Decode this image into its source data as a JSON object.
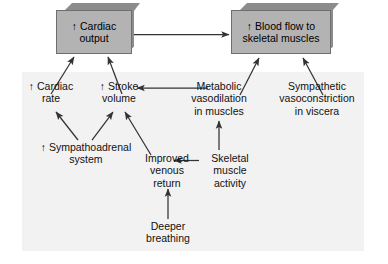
{
  "diagram": {
    "panel_color": "#f2f2f2",
    "box_face_color": "#b3b3b3",
    "box_shade_color": "#8c8c8c",
    "arrow_color": "#333333",
    "text_color": "#111111",
    "boxes": [
      {
        "id": "cardiac-output",
        "line1": "↑ Cardiac",
        "line2": "output",
        "text": "↑ Cardiac output"
      },
      {
        "id": "blood-flow",
        "line1": "↑ Blood flow to",
        "line2": "skeletal muscles",
        "text": "↑ Blood flow to skeletal muscles"
      }
    ],
    "nodes": [
      {
        "id": "cardiac-rate",
        "text": "↑ Cardiac\nrate"
      },
      {
        "id": "stroke-volume",
        "text": "↑ Stroke\nvolume"
      },
      {
        "id": "metabolic-vasodilation",
        "text": "Metabolic\nvasodilation\nin muscles"
      },
      {
        "id": "sympathetic-vasoconstriction",
        "text": "Sympathetic\nvasoconstriction\nin viscera"
      },
      {
        "id": "sympathoadrenal-system",
        "text": "↑ Sympathoadrenal\nsystem"
      },
      {
        "id": "improved-venous-return",
        "text": "Improved\nvenous\nreturn"
      },
      {
        "id": "skeletal-muscle-activity",
        "text": "Skeletal\nmuscle\nactivity"
      },
      {
        "id": "deeper-breathing",
        "text": "Deeper\nbreathing"
      }
    ],
    "edges": [
      {
        "from": "cardiac-output",
        "to": "blood-flow",
        "kind": "horizontal-right"
      },
      {
        "from": "cardiac-rate",
        "to": "cardiac-output",
        "kind": "diagonal-up-right"
      },
      {
        "from": "stroke-volume",
        "to": "cardiac-output",
        "kind": "diagonal-up-left"
      },
      {
        "from": "metabolic-vasodilation",
        "to": "blood-flow",
        "kind": "diagonal-up-right"
      },
      {
        "from": "sympathetic-vasoconstriction",
        "to": "blood-flow",
        "kind": "diagonal-up-left"
      },
      {
        "from": "metabolic-vasodilation",
        "to": "stroke-volume",
        "kind": "horizontal-left"
      },
      {
        "from": "sympathoadrenal-system",
        "to": "cardiac-rate",
        "kind": "diagonal-up-left"
      },
      {
        "from": "sympathoadrenal-system",
        "to": "stroke-volume",
        "kind": "diagonal-up-right"
      },
      {
        "from": "improved-venous-return",
        "to": "stroke-volume",
        "kind": "diagonal-up-left"
      },
      {
        "from": "skeletal-muscle-activity",
        "to": "improved-venous-return",
        "kind": "horizontal-left"
      },
      {
        "from": "skeletal-muscle-activity",
        "to": "metabolic-vasodilation",
        "kind": "vertical-up"
      },
      {
        "from": "deeper-breathing",
        "to": "improved-venous-return",
        "kind": "vertical-up"
      }
    ]
  }
}
